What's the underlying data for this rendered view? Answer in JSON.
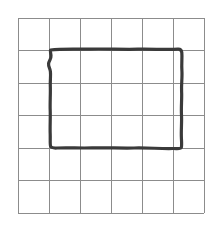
{
  "figure": {
    "canvas": {
      "width": 221,
      "height": 226,
      "background_color": "#ffffff"
    }
  },
  "grid": {
    "name": "square-grid",
    "rows": 6,
    "columns": 6,
    "line_color": "#8c8c8c",
    "line_width": 1,
    "origin_x": 18,
    "origin_y": 18,
    "cell_width": 31,
    "cell_height": 32.5,
    "x_positions": [
      18,
      49,
      80,
      111,
      142,
      173,
      204
    ],
    "y_positions": [
      18,
      50.5,
      83,
      115.5,
      148,
      180.5,
      213
    ]
  },
  "drawing": {
    "name": "hand-drawn-rectangle",
    "shape": "rectangle",
    "stroke_color": "#3a3a3a",
    "stroke_width": 3.2,
    "style": "freehand",
    "bounds": {
      "left": 50,
      "top": 49,
      "right": 182,
      "bottom": 148
    },
    "spans_columns": 4.25,
    "spans_rows": 3.05,
    "path": "M50.5,50.0 C62,48.6 76,49.4 90,49.1 C106,48.7 122,49.6 138,49.2 C152,48.9 166,49.8 178,49.2 C180.5,49.1 181.6,50.4 181.8,52.5 C182.3,58.0 181.4,64.0 181.9,70.5 C182.4,77.5 181.2,84.5 181.6,91.5 C182.0,99.0 181.0,107.0 181.5,115.0 C181.9,122.5 181.0,130.5 181.4,138.0 C181.6,142.5 181.9,145.6 181.3,147.6 C180.8,149.2 177.0,148.4 172.5,148.5 C160.0,148.8 147.0,147.6 134.0,148.0 C120.0,148.4 106.0,147.4 92.0,147.9 C80.0,148.3 68.0,147.5 57.0,148.0 C53.5,148.2 51.2,147.9 50.6,146.3 C49.9,144.4 50.4,139.5 50.2,134.0 C49.9,126.0 50.5,118.0 50.2,110.0 C49.9,102.0 50.6,94.0 50.3,86.0 C50.1,80.5 50.9,75.5 50.4,71.5 C50.0,68.2 48.2,66.5 48.6,63.5 C49.0,60.5 51.4,58.8 51.0,55.5 C50.8,53.5 50.2,51.8 50.5,50.0 Z"
  }
}
